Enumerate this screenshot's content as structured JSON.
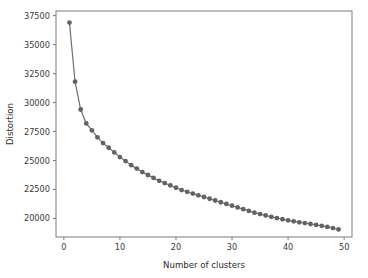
{
  "chart_data": {
    "type": "line",
    "title": "",
    "xlabel": "Number of clusters",
    "ylabel": "Distortion",
    "xlim": [
      -1.4,
      51.4
    ],
    "ylim": [
      18400,
      37900
    ],
    "grid": false,
    "legend": null,
    "xticks": [
      0,
      10,
      20,
      30,
      40,
      50
    ],
    "xtick_labels": [
      "0",
      "10",
      "20",
      "30",
      "40",
      "50"
    ],
    "yticks": [
      20000,
      22500,
      25000,
      27500,
      30000,
      32500,
      35000,
      37500
    ],
    "ytick_labels": [
      "20000",
      "22500",
      "25000",
      "27500",
      "30000",
      "32500",
      "35000",
      "37500"
    ],
    "marker": "circle",
    "line_color": "#6f6f6f",
    "marker_color": "#636363",
    "x": [
      1,
      2,
      3,
      4,
      5,
      6,
      7,
      8,
      9,
      10,
      11,
      12,
      13,
      14,
      15,
      16,
      17,
      18,
      19,
      20,
      21,
      22,
      23,
      24,
      25,
      26,
      27,
      28,
      29,
      30,
      31,
      32,
      33,
      34,
      35,
      36,
      37,
      38,
      39,
      40,
      41,
      42,
      43,
      44,
      45,
      46,
      47,
      48,
      49
    ],
    "values": [
      36900,
      31800,
      29400,
      28200,
      27600,
      27000,
      26500,
      26100,
      25700,
      25300,
      24950,
      24600,
      24300,
      24000,
      23750,
      23500,
      23250,
      23050,
      22850,
      22650,
      22450,
      22300,
      22150,
      22000,
      21850,
      21700,
      21550,
      21400,
      21250,
      21100,
      20950,
      20800,
      20650,
      20500,
      20380,
      20260,
      20140,
      20030,
      19930,
      19840,
      19750,
      19670,
      19600,
      19520,
      19440,
      19360,
      19270,
      19170,
      19050
    ],
    "series": [
      {
        "name": "Distortion",
        "values": [
          36900,
          31800,
          29400,
          28200,
          27600,
          27000,
          26500,
          26100,
          25700,
          25300,
          24950,
          24600,
          24300,
          24000,
          23750,
          23500,
          23250,
          23050,
          22850,
          22650,
          22450,
          22300,
          22150,
          22000,
          21850,
          21700,
          21550,
          21400,
          21250,
          21100,
          20950,
          20800,
          20650,
          20500,
          20380,
          20260,
          20140,
          20030,
          19930,
          19840,
          19750,
          19670,
          19600,
          19520,
          19440,
          19360,
          19270,
          19170,
          19050
        ]
      }
    ]
  }
}
